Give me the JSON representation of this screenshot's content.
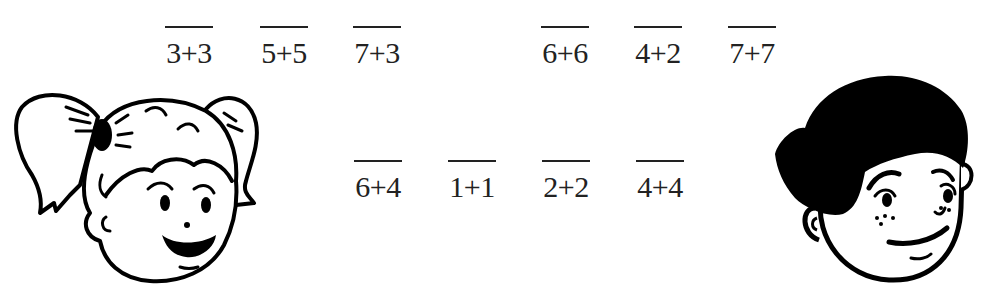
{
  "top_row": {
    "left_group": [
      "3+3",
      "5+5",
      "7+3"
    ],
    "right_group": [
      "6+6",
      "4+2",
      "7+7"
    ]
  },
  "bottom_row": [
    "6+4",
    "1+1",
    "2+2",
    "4+4"
  ],
  "characters": {
    "left": "girl-with-pigtails-icon",
    "right": "boy-with-freckles-icon"
  },
  "colors": {
    "ink": "#222222",
    "background": "#ffffff"
  }
}
